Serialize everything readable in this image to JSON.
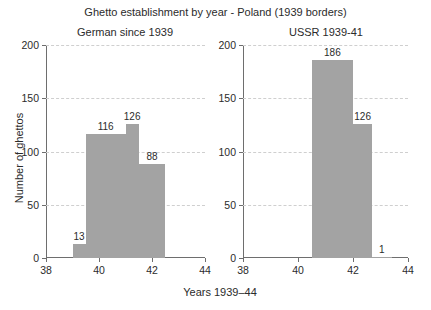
{
  "chart_data": {
    "type": "bar",
    "title": "Ghetto establishment by year - Poland (1939 borders)",
    "xlabel": "Years 1939–44",
    "ylabel": "Number of ghettos",
    "xlim": [
      38,
      44
    ],
    "ylim": [
      0,
      200
    ],
    "xticks": [
      38,
      40,
      42,
      44
    ],
    "xtick_labels": [
      "38",
      "40",
      "42",
      "44"
    ],
    "yticks": [
      0,
      50,
      100,
      150,
      200
    ],
    "ytick_labels": [
      "0",
      "50",
      "100",
      "150",
      "200"
    ],
    "grid": "horizontal-dashed",
    "legend": "none",
    "bar_color": "#a3a3a3",
    "panels": [
      {
        "name": "german-panel",
        "title": "German since 1939",
        "bars": [
          {
            "x0": 39.0,
            "x1": 39.5,
            "value": 13,
            "label": "13"
          },
          {
            "x0": 39.5,
            "x1": 41.0,
            "value": 116,
            "label": "116"
          },
          {
            "x0": 41.0,
            "x1": 41.5,
            "value": 126,
            "label": "126"
          },
          {
            "x0": 41.5,
            "x1": 42.5,
            "value": 88,
            "label": "88"
          }
        ]
      },
      {
        "name": "ussr-panel",
        "title": "USSR 1939-41",
        "bars": [
          {
            "x0": 40.5,
            "x1": 42.0,
            "value": 186,
            "label": "186"
          },
          {
            "x0": 42.0,
            "x1": 42.7,
            "value": 126,
            "label": "126"
          },
          {
            "x0": 42.7,
            "x1": 43.4,
            "value": 1,
            "label": "1"
          }
        ]
      }
    ]
  }
}
